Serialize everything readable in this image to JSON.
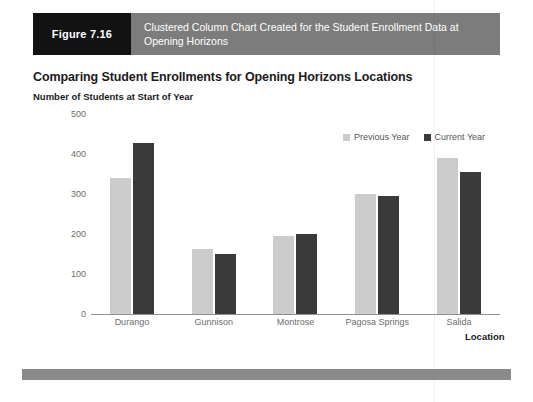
{
  "figure": {
    "number_label": "Figure 7.16",
    "caption": "Clustered Column Chart Created for the Student Enrollment Data at Opening Horizons"
  },
  "chart_header": {
    "title": "Comparing Student Enrollments for Opening Horizons Locations",
    "subtitle": "Number of Students at Start of Year"
  },
  "colors": {
    "previous_year": "#cccccc",
    "current_year": "#3a3a3a",
    "figure_number_bg": "#121212",
    "figure_caption_bg": "#7c7c7c",
    "footer_bar": "#8a8a8a",
    "axis_line": "#8f8f8f",
    "tick_text": "#6d6d6d"
  },
  "chart_data": {
    "type": "bar",
    "title": "Comparing Student Enrollments for Opening Horizons Locations",
    "subtitle": "Number of Students at Start of Year",
    "xlabel": "Location",
    "ylabel": "",
    "ylim": [
      0,
      500
    ],
    "yticks": [
      0,
      100,
      200,
      300,
      400,
      500
    ],
    "ytick_labels": [
      "0",
      "100",
      "200",
      "300",
      "400",
      "500"
    ],
    "grid": false,
    "legend_position": "top-right",
    "categories": [
      "Durango",
      "Gunnison",
      "Montrose",
      "Pagosa Springs",
      "Salida"
    ],
    "series": [
      {
        "name": "Previous Year",
        "color": "#cccccc",
        "values": [
          340,
          163,
          196,
          299,
          390
        ]
      },
      {
        "name": "Current Year",
        "color": "#3a3a3a",
        "values": [
          428,
          151,
          200,
          295,
          355
        ]
      }
    ]
  }
}
